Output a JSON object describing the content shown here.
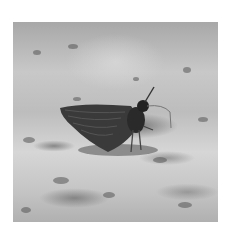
{
  "image": {
    "description": "Black-and-white photograph of a skipper butterfly resting on gravelly ground",
    "subject": "skipper butterfly",
    "style": "grayscale",
    "colors": {
      "background": "#ffffff",
      "ground_light": "#d6d6d6",
      "ground_mid": "#b8b8b8",
      "butterfly": "#3a3a3a"
    }
  }
}
